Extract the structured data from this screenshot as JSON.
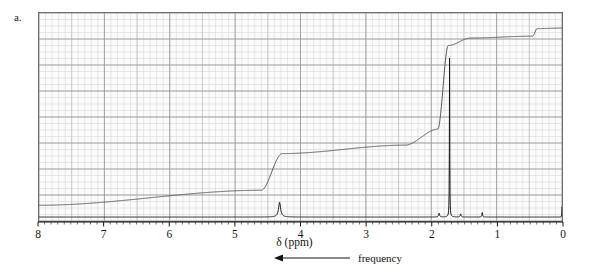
{
  "figure": {
    "panel_label": "a.",
    "x_axis_title": "δ (ppm)",
    "frequency_annotation": {
      "label": "frequency",
      "arrow_direction": "left",
      "arrow_icon": "left-arrow-icon"
    },
    "colors": {
      "trace": "#1a1a1a",
      "integral": "#555555",
      "grid_major": "#9a9a9a",
      "grid_minor": "#d9d9d9",
      "plot_border": "#6d6d6d",
      "background": "#fbfbfb",
      "text": "#141414"
    }
  },
  "chart_data": {
    "type": "line",
    "title": "",
    "subtitle": "",
    "xlabel": "δ (ppm)",
    "ylabel": "",
    "xlim": [
      8,
      0
    ],
    "ylim": [
      0,
      1
    ],
    "x_inverted": true,
    "grid": true,
    "legend": "none",
    "xticks": [
      8,
      7,
      6,
      5,
      4,
      3,
      2,
      1,
      0
    ],
    "xtick_labels": [
      "8",
      "7",
      "6",
      "5",
      "4",
      "3",
      "2",
      "1",
      "0"
    ],
    "yticks": [],
    "ytick_labels": [],
    "annotations": [
      "frequency"
    ],
    "series": [
      {
        "name": "1H NMR spectrum",
        "kind": "spectrum",
        "peaks": [
          {
            "shift_ppm": 4.32,
            "height": 0.085,
            "width_ppm": 0.075,
            "multiplicity": "multiplet",
            "label": ""
          },
          {
            "shift_ppm": 1.72,
            "height": 0.915,
            "width_ppm": 0.012,
            "multiplicity": "singlet",
            "label": ""
          },
          {
            "shift_ppm": 1.88,
            "height": 0.022,
            "width_ppm": 0.035,
            "multiplicity": "small",
            "label": ""
          },
          {
            "shift_ppm": 1.55,
            "height": 0.018,
            "width_ppm": 0.03,
            "multiplicity": "small",
            "label": ""
          },
          {
            "shift_ppm": 1.22,
            "height": 0.028,
            "width_ppm": 0.022,
            "multiplicity": "small",
            "label": ""
          },
          {
            "shift_ppm": 0.0,
            "height": 0.06,
            "width_ppm": 0.01,
            "multiplicity": "TMS reference",
            "label": ""
          }
        ],
        "baseline": 0.0
      },
      {
        "name": "integral trace",
        "kind": "integral",
        "steps": [
          {
            "shift_ppm": 8.0,
            "level": 0.025
          },
          {
            "shift_ppm": 4.6,
            "level": 0.105
          },
          {
            "shift_ppm": 4.28,
            "level": 0.3
          },
          {
            "shift_ppm": 2.4,
            "level": 0.345
          },
          {
            "shift_ppm": 1.9,
            "level": 0.43
          },
          {
            "shift_ppm": 1.74,
            "level": 0.875
          },
          {
            "shift_ppm": 1.4,
            "level": 0.915
          },
          {
            "shift_ppm": 0.45,
            "level": 0.925
          },
          {
            "shift_ppm": 0.38,
            "level": 0.965
          },
          {
            "shift_ppm": 0.0,
            "level": 0.968
          }
        ]
      }
    ]
  }
}
